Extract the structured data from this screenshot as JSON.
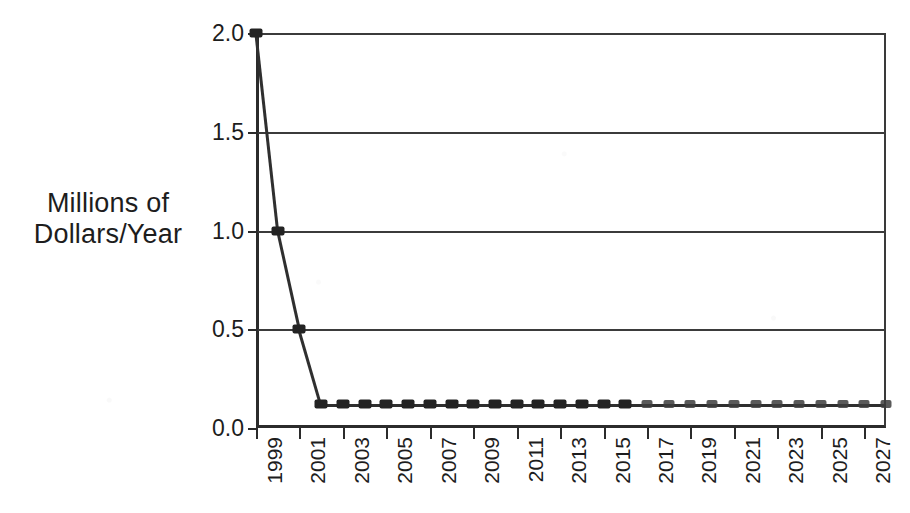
{
  "chart_data": {
    "type": "line",
    "title": "",
    "xlabel": "",
    "ylabel": "Millions of\nDollars/Year",
    "ylim": [
      0.0,
      2.0
    ],
    "yticks": [
      "0.0",
      "0.5",
      "1.0",
      "1.5",
      "2.0"
    ],
    "ytick_values": [
      0.0,
      0.5,
      1.0,
      1.5,
      2.0
    ],
    "grid": true,
    "grid_axis": "y",
    "legend": "none",
    "marker": "square",
    "line_color": "#2f2f2f",
    "marker_color": "#232323",
    "axis_color": "#2b2b2b",
    "background": "#ffffff",
    "xlim": [
      1999,
      2028
    ],
    "xtick_labels": [
      "1999",
      "2001",
      "2003",
      "2005",
      "2007",
      "2009",
      "2011",
      "2013",
      "2015",
      "2017",
      "2019",
      "2021",
      "2023",
      "2025",
      "2027"
    ],
    "xtick_values": [
      1999,
      2001,
      2003,
      2005,
      2007,
      2009,
      2011,
      2013,
      2015,
      2017,
      2019,
      2021,
      2023,
      2025,
      2027
    ],
    "x": [
      1999,
      2000,
      2001,
      2002,
      2003,
      2004,
      2005,
      2006,
      2007,
      2008,
      2009,
      2010,
      2011,
      2012,
      2013,
      2014,
      2015,
      2016,
      2017,
      2018,
      2019,
      2020,
      2021,
      2022,
      2023,
      2024,
      2025,
      2026,
      2027,
      2028
    ],
    "series": [
      {
        "name": "Funding",
        "values": [
          2.0,
          1.0,
          0.5,
          0.12,
          0.12,
          0.12,
          0.12,
          0.12,
          0.12,
          0.12,
          0.12,
          0.12,
          0.12,
          0.12,
          0.12,
          0.12,
          0.12,
          0.12,
          0.12,
          0.12,
          0.12,
          0.12,
          0.12,
          0.12,
          0.12,
          0.12,
          0.12,
          0.12,
          0.12,
          0.12
        ]
      }
    ]
  }
}
